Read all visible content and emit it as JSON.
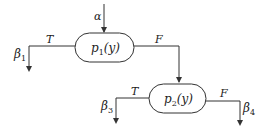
{
  "diagram": {
    "type": "flow-branching",
    "entry": {
      "label": "α"
    },
    "nodes": [
      {
        "id": "p1",
        "label": "p",
        "subscript": "1",
        "arg": "(y)",
        "true_branch": {
          "edge_label": "T",
          "target_label": "β",
          "target_subscript": "1"
        },
        "false_branch": {
          "edge_label": "F",
          "target": "p2"
        }
      },
      {
        "id": "p2",
        "label": "p",
        "subscript": "2",
        "arg": "(y)",
        "true_branch": {
          "edge_label": "T",
          "target_label": "β",
          "target_subscript": "3"
        },
        "false_branch": {
          "edge_label": "F",
          "target_label": "β",
          "target_subscript": "4"
        }
      }
    ]
  }
}
